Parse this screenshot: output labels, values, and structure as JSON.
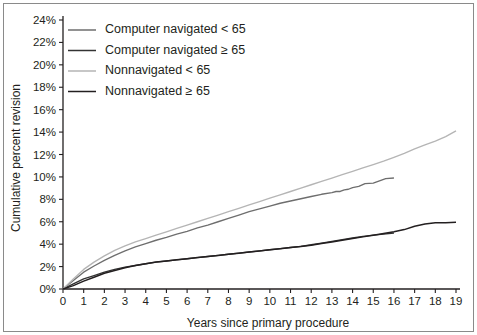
{
  "figure": {
    "background": "#ffffff",
    "frame_color": "#8a8a8a"
  },
  "chart_data": {
    "type": "line",
    "title": "",
    "xlabel": "Years since primary procedure",
    "ylabel": "Cumulative percent revision",
    "xlim": [
      0,
      19
    ],
    "ylim": [
      0,
      24
    ],
    "xticks": [
      0,
      1,
      2,
      3,
      4,
      5,
      6,
      7,
      8,
      9,
      10,
      11,
      12,
      13,
      14,
      15,
      16,
      17,
      18,
      19
    ],
    "xtick_labels": [
      "0",
      "1",
      "2",
      "3",
      "4",
      "5",
      "6",
      "7",
      "8",
      "9",
      "10",
      "11",
      "12",
      "13",
      "14",
      "15",
      "16",
      "17",
      "18",
      "19"
    ],
    "yticks": [
      0,
      2,
      4,
      6,
      8,
      10,
      12,
      14,
      16,
      18,
      20,
      22,
      24
    ],
    "ytick_labels": [
      "0%",
      "2%",
      "4%",
      "6%",
      "8%",
      "10%",
      "12%",
      "14%",
      "16%",
      "18%",
      "20%",
      "22%",
      "24%"
    ],
    "grid": false,
    "legend_position": "top-left",
    "series": [
      {
        "name": "Computer navigated < 65",
        "color": "#6e6e6e",
        "width": 1.35,
        "x": [
          0,
          0.5,
          1,
          1.5,
          2,
          2.5,
          3,
          3.5,
          4,
          4.5,
          5,
          5.5,
          6,
          6.5,
          7,
          7.5,
          8,
          8.5,
          9,
          9.5,
          10,
          10.5,
          11,
          11.5,
          12,
          12.5,
          13,
          13.2,
          13.4,
          13.6,
          13.8,
          14,
          14.3,
          14.6,
          15,
          15.3,
          15.6,
          16
        ],
        "values": [
          0,
          0.75,
          1.5,
          2.05,
          2.55,
          3.0,
          3.4,
          3.75,
          4.05,
          4.35,
          4.6,
          4.9,
          5.15,
          5.45,
          5.7,
          6.0,
          6.3,
          6.6,
          6.9,
          7.15,
          7.4,
          7.65,
          7.85,
          8.05,
          8.25,
          8.45,
          8.6,
          8.7,
          8.7,
          8.85,
          8.9,
          9.05,
          9.15,
          9.4,
          9.45,
          9.65,
          9.85,
          9.9
        ]
      },
      {
        "name": "Computer navigated ≥ 65",
        "color": "#333333",
        "width": 1.35,
        "x": [
          0,
          0.5,
          1,
          1.5,
          2,
          2.5,
          3,
          3.5,
          4,
          4.5,
          5,
          5.5,
          6,
          6.5,
          7,
          7.5,
          8,
          8.5,
          9,
          9.5,
          10,
          10.5,
          11,
          11.5,
          12,
          12.5,
          13,
          13.5,
          14,
          14.5,
          15,
          15.5,
          16
        ],
        "values": [
          0,
          0.45,
          0.9,
          1.2,
          1.5,
          1.75,
          1.95,
          2.1,
          2.25,
          2.4,
          2.5,
          2.6,
          2.7,
          2.8,
          2.9,
          3.0,
          3.1,
          3.2,
          3.3,
          3.4,
          3.5,
          3.6,
          3.7,
          3.8,
          3.95,
          4.1,
          4.25,
          4.4,
          4.55,
          4.7,
          4.8,
          4.9,
          5.0
        ]
      },
      {
        "name": "Nonnavigated < 65",
        "color": "#b5b5b5",
        "width": 1.35,
        "x": [
          0,
          0.5,
          1,
          1.5,
          2,
          2.5,
          3,
          3.5,
          4,
          4.5,
          5,
          5.5,
          6,
          6.5,
          7,
          7.5,
          8,
          8.5,
          9,
          9.5,
          10,
          10.5,
          11,
          11.5,
          12,
          12.5,
          13,
          13.5,
          14,
          14.5,
          15,
          15.5,
          16,
          16.5,
          17,
          17.5,
          18,
          18.5,
          19
        ],
        "values": [
          0,
          0.9,
          1.75,
          2.4,
          2.95,
          3.45,
          3.85,
          4.2,
          4.5,
          4.8,
          5.1,
          5.4,
          5.7,
          6.0,
          6.3,
          6.6,
          6.9,
          7.2,
          7.5,
          7.8,
          8.1,
          8.4,
          8.7,
          9.0,
          9.3,
          9.6,
          9.9,
          10.2,
          10.5,
          10.8,
          11.1,
          11.4,
          11.75,
          12.1,
          12.5,
          12.85,
          13.2,
          13.6,
          14.1
        ]
      },
      {
        "name": "Nonnavigated ≥ 65",
        "color": "#231f20",
        "width": 1.5,
        "x": [
          0,
          0.5,
          1,
          1.5,
          2,
          2.5,
          3,
          3.5,
          4,
          4.5,
          5,
          5.5,
          6,
          6.5,
          7,
          7.5,
          8,
          8.5,
          9,
          9.5,
          10,
          10.5,
          11,
          11.5,
          12,
          12.5,
          13,
          13.5,
          14,
          14.5,
          15,
          15.5,
          16,
          16.5,
          17,
          17.5,
          18,
          18.5,
          19
        ],
        "values": [
          0,
          0.3,
          0.7,
          1.05,
          1.4,
          1.65,
          1.9,
          2.1,
          2.25,
          2.4,
          2.5,
          2.6,
          2.7,
          2.8,
          2.9,
          3.0,
          3.1,
          3.2,
          3.3,
          3.4,
          3.5,
          3.6,
          3.7,
          3.8,
          3.9,
          4.05,
          4.2,
          4.35,
          4.5,
          4.65,
          4.8,
          4.95,
          5.1,
          5.3,
          5.6,
          5.8,
          5.9,
          5.92,
          5.95
        ]
      }
    ]
  },
  "legend": {
    "entries": [
      {
        "label": "Computer navigated < 65",
        "color": "#6e6e6e"
      },
      {
        "label": "Computer navigated ≥ 65",
        "color": "#333333"
      },
      {
        "label": "Nonnavigated < 65",
        "color": "#b5b5b5"
      },
      {
        "label": "Nonnavigated ≥ 65",
        "color": "#231f20"
      }
    ]
  }
}
